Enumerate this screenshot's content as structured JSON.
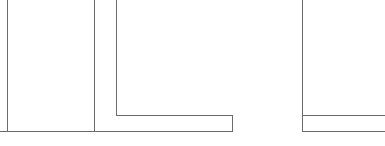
{
  "document": {
    "title": "Line Drawing",
    "kind": "technical-line-drawing",
    "description": "Monochrome CAD-style wall outline fragment"
  },
  "canvas": {
    "width": 385,
    "height": 146,
    "background_color": "#ffffff"
  },
  "style": {
    "stroke_color": "#6b6b6b",
    "stroke_width": 1.1,
    "fill": "none"
  },
  "geometry": {
    "units": "px",
    "paths": [
      {
        "name": "left-vertical-rule",
        "type": "polyline",
        "points": [
          [
            7.5,
            0
          ],
          [
            7.5,
            131.5
          ]
        ]
      },
      {
        "name": "inner-vertical-rule",
        "type": "polyline",
        "points": [
          [
            94.5,
            0
          ],
          [
            94.5,
            131.5
          ]
        ]
      },
      {
        "name": "l-shape-outline",
        "type": "polyline",
        "points": [
          [
            116.5,
            0
          ],
          [
            116.5,
            115.5
          ],
          [
            232.5,
            115.5
          ],
          [
            232.5,
            131.5
          ]
        ]
      },
      {
        "name": "bottom-rail-left",
        "type": "polyline",
        "points": [
          [
            0,
            131.5
          ],
          [
            232.5,
            131.5
          ]
        ]
      },
      {
        "name": "right-vertical-rule",
        "type": "polyline",
        "points": [
          [
            302.5,
            0
          ],
          [
            302.5,
            131.5
          ]
        ]
      },
      {
        "name": "right-upper-rail",
        "type": "polyline",
        "points": [
          [
            302.5,
            115.5
          ],
          [
            385,
            115.5
          ]
        ]
      },
      {
        "name": "bottom-rail-right",
        "type": "polyline",
        "points": [
          [
            302.5,
            131.5
          ],
          [
            385,
            131.5
          ]
        ]
      }
    ]
  }
}
